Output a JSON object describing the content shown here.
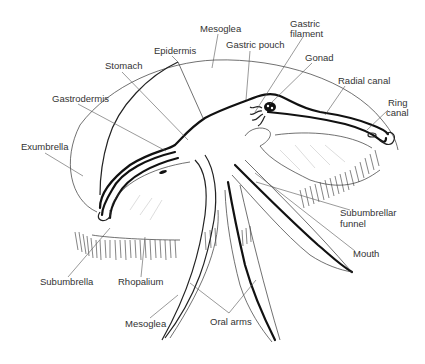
{
  "diagram": {
    "labels": [
      {
        "id": "mesoglea-top",
        "text": "Mesoglea",
        "x": 200,
        "y": 32,
        "lx": 212,
        "ly": 68
      },
      {
        "id": "gastric-filament",
        "text": "Gastric",
        "text2": "filament",
        "x": 290,
        "y": 27,
        "lx": 255,
        "ly": 112
      },
      {
        "id": "gastric-pouch",
        "text": "Gastric pouch",
        "x": 226,
        "y": 48,
        "lx": 246,
        "ly": 100
      },
      {
        "id": "gonad",
        "text": "Gonad",
        "x": 305,
        "y": 61,
        "lx": 270,
        "ly": 104
      },
      {
        "id": "epidermis",
        "text": "Epidermis",
        "x": 154,
        "y": 54,
        "lx": 178,
        "ly": 62
      },
      {
        "id": "stomach",
        "text": "Stomach",
        "x": 105,
        "y": 69,
        "lx": 188,
        "ly": 140
      },
      {
        "id": "radial-canal",
        "text": "Radial canal",
        "x": 338,
        "y": 84,
        "lx": 325,
        "ly": 115
      },
      {
        "id": "ring-canal",
        "text": "Ring",
        "text2": "canal",
        "x": 386,
        "y": 106,
        "lx": 367,
        "ly": 130
      },
      {
        "id": "gastrodermis",
        "text": "Gastrodermis",
        "x": 52,
        "y": 102,
        "lx": 166,
        "ly": 151
      },
      {
        "id": "exumbrella",
        "text": "Exumbrella",
        "x": 21,
        "y": 150,
        "lx": 83,
        "ly": 176
      },
      {
        "id": "subumbrellar-funnel",
        "text": "Subumbrellar",
        "text2": "funnel",
        "x": 340,
        "y": 216,
        "lx": 256,
        "ly": 182
      },
      {
        "id": "mouth",
        "text": "Mouth",
        "x": 353,
        "y": 257,
        "lx": 255,
        "ly": 173
      },
      {
        "id": "subumbrella",
        "text": "Subumbrella",
        "x": 40,
        "y": 285,
        "lx": 110,
        "ly": 228
      },
      {
        "id": "rhopalium",
        "text": "Rhopalium",
        "x": 118,
        "y": 285,
        "lx": 145,
        "ly": 237
      },
      {
        "id": "mesoglea-bottom",
        "text": "Mesoglea",
        "x": 125,
        "y": 327,
        "lx": 178,
        "ly": 295
      },
      {
        "id": "oral-arms",
        "text": "Oral arms",
        "x": 210,
        "y": 325,
        "lx": 229,
        "ly": 313
      }
    ],
    "oral_arms_leaders": [
      {
        "x1": 229,
        "y1": 313,
        "x2": 190,
        "y2": 283
      },
      {
        "x1": 229,
        "y1": 313,
        "x2": 256,
        "y2": 280
      }
    ],
    "colors": {
      "background": "#ffffff",
      "ink": "#111111",
      "label": "#333333",
      "leader": "#555555"
    }
  }
}
